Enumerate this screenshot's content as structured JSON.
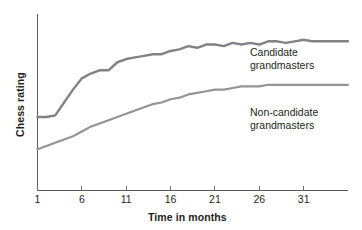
{
  "chart_data": {
    "type": "line",
    "title": "",
    "xlabel": "Time in months",
    "ylabel": "Chess rating",
    "grid": false,
    "legend_position": "inline-right",
    "xlim": [
      1,
      36
    ],
    "ylim": [
      0,
      100
    ],
    "xticks": [
      1,
      6,
      11,
      16,
      21,
      26,
      31
    ],
    "xticklabels": [
      "1",
      "6",
      "11",
      "16",
      "21",
      "26",
      "31"
    ],
    "yticks": [],
    "yticklabels": [],
    "series": [
      {
        "name": "Candidate grandmasters",
        "color": "#808285",
        "label_line1": "Candidate",
        "label_line2": "grandmasters",
        "x": [
          1,
          2,
          3,
          4,
          5,
          6,
          7,
          8,
          9,
          10,
          11,
          12,
          13,
          14,
          15,
          16,
          17,
          18,
          19,
          20,
          21,
          22,
          23,
          24,
          25,
          26,
          27,
          28,
          29,
          30,
          31,
          32,
          33,
          34,
          35,
          36
        ],
        "values": [
          41,
          41,
          42,
          50,
          58,
          65,
          68,
          70,
          70,
          75,
          77,
          78,
          79,
          80,
          80,
          82,
          83,
          85,
          84,
          86,
          86,
          85,
          87,
          86,
          87,
          86,
          88,
          88,
          87,
          88,
          89,
          88,
          88,
          88,
          88,
          88
        ]
      },
      {
        "name": "Non-candidate grandmasters",
        "color": "#929497",
        "label_line1": "Non-candidate",
        "label_line2": "grandmasters",
        "x": [
          1,
          2,
          3,
          4,
          5,
          6,
          7,
          8,
          9,
          10,
          11,
          12,
          13,
          14,
          15,
          16,
          17,
          18,
          19,
          20,
          21,
          22,
          23,
          24,
          25,
          26,
          27,
          28,
          29,
          30,
          31,
          32,
          33,
          34,
          35,
          36
        ],
        "values": [
          21,
          23,
          25,
          27,
          29,
          32,
          35,
          37,
          39,
          41,
          43,
          45,
          47,
          49,
          50,
          52,
          53,
          55,
          56,
          57,
          58,
          58,
          59,
          60,
          60,
          60,
          61,
          61,
          61,
          61,
          61,
          61,
          61,
          61,
          61,
          61
        ]
      }
    ]
  },
  "colors": {
    "axis": "#58595b",
    "tick": "#6d6e71",
    "text": "#231f20",
    "background": "#ffffff"
  }
}
